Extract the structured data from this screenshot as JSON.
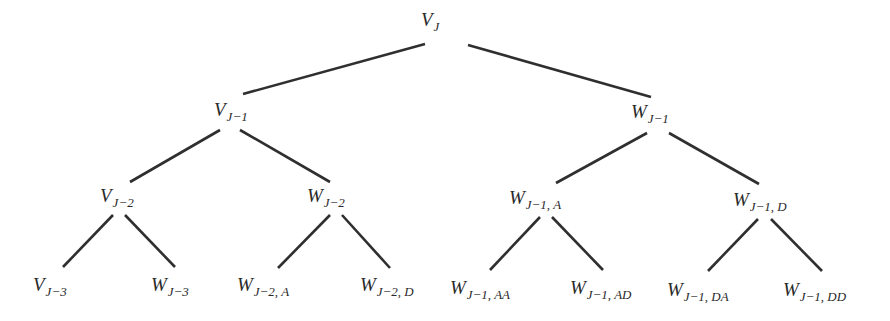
{
  "diagram": {
    "type": "binary-tree",
    "line_color": "#2f2f2f",
    "background": "#ffffff",
    "nodes": [
      {
        "id": "vj",
        "base": "V",
        "sub": "J",
        "x": 421,
        "y": 10
      },
      {
        "id": "vj1",
        "base": "V",
        "sub": "J−1",
        "x": 214,
        "y": 100
      },
      {
        "id": "wj1",
        "base": "W",
        "sub": "J−1",
        "x": 631,
        "y": 102
      },
      {
        "id": "vj2",
        "base": "V",
        "sub": "J−2",
        "x": 100,
        "y": 186
      },
      {
        "id": "wj2",
        "base": "W",
        "sub": "J−2",
        "x": 307,
        "y": 186
      },
      {
        "id": "wj1a",
        "base": "W",
        "sub": "J−1, A",
        "x": 509,
        "y": 188
      },
      {
        "id": "wj1d",
        "base": "W",
        "sub": "J−1, D",
        "x": 733,
        "y": 190
      },
      {
        "id": "vj3",
        "base": "V",
        "sub": "J−3",
        "x": 33,
        "y": 275
      },
      {
        "id": "wj3",
        "base": "W",
        "sub": "J−3",
        "x": 151,
        "y": 275
      },
      {
        "id": "wj2a",
        "base": "W",
        "sub": "J−2, A",
        "x": 237,
        "y": 275
      },
      {
        "id": "wj2d",
        "base": "W",
        "sub": "J−2, D",
        "x": 360,
        "y": 275
      },
      {
        "id": "wj1aa",
        "base": "W",
        "sub": "J−1, AA",
        "x": 450,
        "y": 278
      },
      {
        "id": "wj1ad",
        "base": "W",
        "sub": "J−1, AD",
        "x": 570,
        "y": 278
      },
      {
        "id": "wj1da",
        "base": "W",
        "sub": "J−1, DA",
        "x": 667,
        "y": 280
      },
      {
        "id": "wj1dd",
        "base": "W",
        "sub": "J−1, DD",
        "x": 783,
        "y": 280
      }
    ],
    "edges": [
      {
        "from": "vj",
        "to": "vj1",
        "x1": 425,
        "y1": 44,
        "x2": 243,
        "y2": 94
      },
      {
        "from": "vj",
        "to": "wj1",
        "x1": 468,
        "y1": 45,
        "x2": 651,
        "y2": 97
      },
      {
        "from": "vj1",
        "to": "vj2",
        "x1": 220,
        "y1": 130,
        "x2": 130,
        "y2": 182
      },
      {
        "from": "vj1",
        "to": "wj2",
        "x1": 240,
        "y1": 130,
        "x2": 330,
        "y2": 182
      },
      {
        "from": "wj1",
        "to": "wj1a",
        "x1": 647,
        "y1": 133,
        "x2": 556,
        "y2": 183
      },
      {
        "from": "wj1",
        "to": "wj1d",
        "x1": 669,
        "y1": 133,
        "x2": 759,
        "y2": 184
      },
      {
        "from": "vj2",
        "to": "vj3",
        "x1": 113,
        "y1": 215,
        "x2": 63,
        "y2": 267
      },
      {
        "from": "vj2",
        "to": "wj3",
        "x1": 125,
        "y1": 215,
        "x2": 175,
        "y2": 267
      },
      {
        "from": "wj2",
        "to": "wj2a",
        "x1": 330,
        "y1": 215,
        "x2": 278,
        "y2": 268
      },
      {
        "from": "wj2",
        "to": "wj2d",
        "x1": 342,
        "y1": 215,
        "x2": 390,
        "y2": 268
      },
      {
        "from": "wj1a",
        "to": "wj1aa",
        "x1": 540,
        "y1": 217,
        "x2": 490,
        "y2": 270
      },
      {
        "from": "wj1a",
        "to": "wj1ad",
        "x1": 552,
        "y1": 217,
        "x2": 603,
        "y2": 270
      },
      {
        "from": "wj1d",
        "to": "wj1da",
        "x1": 758,
        "y1": 219,
        "x2": 708,
        "y2": 271
      },
      {
        "from": "wj1d",
        "to": "wj1dd",
        "x1": 771,
        "y1": 219,
        "x2": 822,
        "y2": 271
      }
    ]
  }
}
